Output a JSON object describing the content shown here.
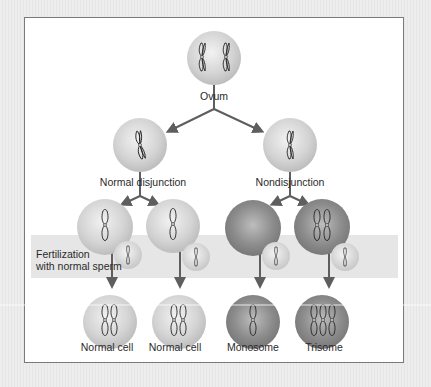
{
  "diagram": {
    "nodes": {
      "ovum": {
        "label": "Ovum"
      },
      "normal_disjunction": {
        "label": "Normal disjunction"
      },
      "nondisjunction": {
        "label": "Nondisjunction"
      }
    },
    "band": {
      "label_line1": "Fertilization",
      "label_line2": "with normal sperm"
    },
    "outcomes": [
      {
        "label": "Normal cell"
      },
      {
        "label": "Normal cell"
      },
      {
        "label": "Monosome"
      },
      {
        "label": "Trisome"
      }
    ],
    "colors": {
      "light_cell": "#d4d4d4",
      "dark_cell": "#8c8c8c",
      "arrow": "#5e5e5e",
      "band": "#e6e6e6",
      "frame_border": "#7a7a7a"
    }
  }
}
